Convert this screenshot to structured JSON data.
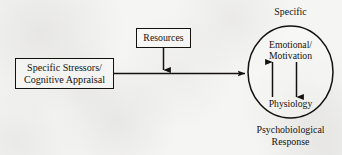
{
  "diagram": {
    "background_color": "#f5f5f3",
    "ink_color": "#16130f",
    "nodes": {
      "stressors": {
        "line1": "Specific Stressors/",
        "line2": "Cognitive Appraisal",
        "shape": "rectangle"
      },
      "resources": {
        "label": "Resources",
        "shape": "rectangle"
      },
      "response_oval": {
        "shape": "ellipse",
        "top_label": "Specific",
        "bottom_label_line1": "Psychobiological",
        "bottom_label_line2": "Response",
        "inner_top_line1": "Emotional/",
        "inner_top_line2": "Motivation",
        "inner_bottom": "Physiology"
      }
    },
    "connectors": {
      "stressors_to_oval": {
        "name": "horizontal arrow",
        "direction": "right"
      },
      "resources_to_path": {
        "name": "vertical arrow from resources",
        "direction": "down"
      },
      "physiology_to_emotional": {
        "name": "upward internal arrow",
        "direction": "up"
      },
      "emotional_to_physiology": {
        "name": "downward internal arrow",
        "direction": "down"
      }
    }
  }
}
